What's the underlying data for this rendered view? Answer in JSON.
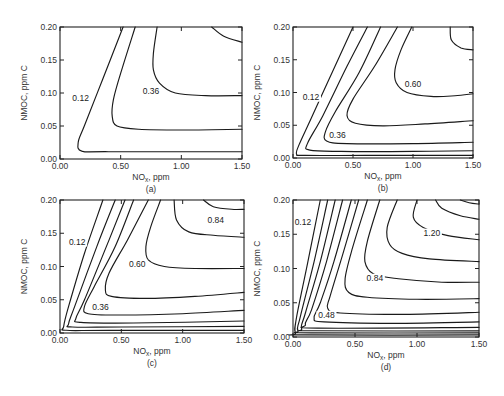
{
  "chart_data": [
    {
      "type": "contour",
      "panel": "(a)",
      "xlabel": "NOx, ppm",
      "ylabel": "NMOC, ppm C",
      "xlim": [
        0.0,
        1.5
      ],
      "ylim": [
        0.0,
        0.2
      ],
      "xticks": [
        "0.00",
        "0.50",
        "1.00",
        "1.50"
      ],
      "yticks": [
        "0.00",
        "0.05",
        "0.10",
        "0.15",
        "0.20"
      ],
      "levels": [
        0.12,
        0.24,
        0.36,
        0.48
      ],
      "labeled_levels": [
        {
          "text": "0.12",
          "x": 0.17,
          "y": 0.088
        },
        {
          "text": "0.36",
          "x": 0.75,
          "y": 0.099
        }
      ],
      "frame": {
        "x0": 60,
        "x1": 242,
        "y0": 159,
        "y1": 27
      },
      "contours": [
        [
          [
            0.52,
            0.2
          ],
          [
            0.35,
            0.12
          ],
          [
            0.2,
            0.05
          ],
          [
            0.15,
            0.025
          ],
          [
            0.18,
            0.012
          ],
          [
            0.4,
            0.011
          ],
          [
            1.5,
            0.011
          ]
        ],
        [
          [
            0.62,
            0.2
          ],
          [
            0.5,
            0.13
          ],
          [
            0.44,
            0.09
          ],
          [
            0.43,
            0.065
          ],
          [
            0.47,
            0.05
          ],
          [
            0.65,
            0.045
          ],
          [
            1.0,
            0.044
          ],
          [
            1.5,
            0.045
          ]
        ],
        [
          [
            0.8,
            0.2
          ],
          [
            0.77,
            0.16
          ],
          [
            0.77,
            0.135
          ],
          [
            0.82,
            0.115
          ],
          [
            0.95,
            0.1
          ],
          [
            1.2,
            0.096
          ],
          [
            1.5,
            0.096
          ]
        ],
        [
          [
            1.25,
            0.2
          ],
          [
            1.35,
            0.186
          ],
          [
            1.5,
            0.177
          ]
        ]
      ]
    },
    {
      "type": "contour",
      "panel": "(b)",
      "xlabel": "NOx, ppm",
      "ylabel": "NMOC, ppm C",
      "xlim": [
        0.0,
        1.5
      ],
      "ylim": [
        0.0,
        0.2
      ],
      "xticks": [
        "0.00",
        "0.50",
        "1.00",
        "1.50"
      ],
      "yticks": [
        "0.00",
        "0.05",
        "0.10",
        "0.15",
        "0.20"
      ],
      "levels": [
        0.12,
        0.24,
        0.36,
        0.48,
        0.6,
        0.72
      ],
      "labeled_levels": [
        {
          "text": "0.12",
          "x": 0.15,
          "y": 0.089
        },
        {
          "text": "0.36",
          "x": 0.37,
          "y": 0.031
        },
        {
          "text": "0.60",
          "x": 1.0,
          "y": 0.108
        }
      ],
      "frame": {
        "x0": 293,
        "x1": 473,
        "y0": 158,
        "y1": 27
      },
      "contours": [
        [
          [
            0.5,
            0.2
          ],
          [
            0.35,
            0.14
          ],
          [
            0.15,
            0.06
          ],
          [
            0.05,
            0.02
          ],
          [
            0.03,
            0.006
          ],
          [
            0.1,
            0.004
          ],
          [
            0.6,
            0.004
          ],
          [
            1.5,
            0.004
          ]
        ],
        [
          [
            0.62,
            0.2
          ],
          [
            0.45,
            0.14
          ],
          [
            0.25,
            0.065
          ],
          [
            0.12,
            0.022
          ],
          [
            0.14,
            0.012
          ],
          [
            0.4,
            0.01
          ],
          [
            1.0,
            0.01
          ],
          [
            1.5,
            0.011
          ]
        ],
        [
          [
            0.73,
            0.2
          ],
          [
            0.55,
            0.13
          ],
          [
            0.35,
            0.07
          ],
          [
            0.27,
            0.04
          ],
          [
            0.28,
            0.026
          ],
          [
            0.45,
            0.022
          ],
          [
            1.0,
            0.022
          ],
          [
            1.5,
            0.024
          ]
        ],
        [
          [
            0.87,
            0.2
          ],
          [
            0.68,
            0.14
          ],
          [
            0.5,
            0.09
          ],
          [
            0.45,
            0.065
          ],
          [
            0.52,
            0.053
          ],
          [
            0.75,
            0.049
          ],
          [
            1.1,
            0.052
          ],
          [
            1.5,
            0.057
          ]
        ],
        [
          [
            0.99,
            0.2
          ],
          [
            0.9,
            0.165
          ],
          [
            0.85,
            0.135
          ],
          [
            0.86,
            0.115
          ],
          [
            0.95,
            0.1
          ],
          [
            1.15,
            0.094
          ],
          [
            1.35,
            0.095
          ],
          [
            1.5,
            0.098
          ]
        ],
        [
          [
            1.31,
            0.2
          ],
          [
            1.32,
            0.18
          ],
          [
            1.4,
            0.168
          ],
          [
            1.5,
            0.165
          ]
        ]
      ]
    },
    {
      "type": "contour",
      "panel": "(c)",
      "xlabel": "NOx, ppm",
      "ylabel": "NMOC, ppm C",
      "xlim": [
        0.0,
        1.5
      ],
      "ylim": [
        0.0,
        0.2
      ],
      "xticks": [
        "0.00",
        "0.50",
        "1.00",
        "1.50"
      ],
      "yticks": [
        "0.00",
        "0.05",
        "0.10",
        "0.15",
        "0.20"
      ],
      "levels": [
        0.12,
        0.24,
        0.36,
        0.48,
        0.6,
        0.72,
        0.84
      ],
      "labeled_levels": [
        {
          "text": "0.12",
          "x": 0.14,
          "y": 0.133
        },
        {
          "text": "0.36",
          "x": 0.33,
          "y": 0.034
        },
        {
          "text": "0.60",
          "x": 0.63,
          "y": 0.1
        },
        {
          "text": "0.84",
          "x": 1.27,
          "y": 0.166
        }
      ],
      "frame": {
        "x0": 60,
        "x1": 244,
        "y0": 333,
        "y1": 200
      },
      "contours": [
        [
          [
            0.35,
            0.2
          ],
          [
            0.2,
            0.12
          ],
          [
            0.07,
            0.04
          ],
          [
            0.03,
            0.01
          ],
          [
            0.05,
            0.004
          ],
          [
            0.4,
            0.004
          ],
          [
            1.5,
            0.004
          ]
        ],
        [
          [
            0.45,
            0.2
          ],
          [
            0.3,
            0.13
          ],
          [
            0.12,
            0.04
          ],
          [
            0.07,
            0.014
          ],
          [
            0.1,
            0.009
          ],
          [
            0.5,
            0.009
          ],
          [
            1.5,
            0.01
          ]
        ],
        [
          [
            0.53,
            0.2
          ],
          [
            0.4,
            0.14
          ],
          [
            0.2,
            0.05
          ],
          [
            0.13,
            0.022
          ],
          [
            0.17,
            0.016
          ],
          [
            0.6,
            0.015
          ],
          [
            1.5,
            0.018
          ]
        ],
        [
          [
            0.6,
            0.2
          ],
          [
            0.45,
            0.13
          ],
          [
            0.28,
            0.07
          ],
          [
            0.2,
            0.04
          ],
          [
            0.23,
            0.029
          ],
          [
            0.5,
            0.027
          ],
          [
            1.0,
            0.029
          ],
          [
            1.5,
            0.034
          ]
        ],
        [
          [
            0.72,
            0.2
          ],
          [
            0.55,
            0.14
          ],
          [
            0.4,
            0.09
          ],
          [
            0.37,
            0.065
          ],
          [
            0.42,
            0.055
          ],
          [
            0.7,
            0.052
          ],
          [
            1.1,
            0.055
          ],
          [
            1.5,
            0.061
          ]
        ],
        [
          [
            0.82,
            0.2
          ],
          [
            0.74,
            0.16
          ],
          [
            0.7,
            0.13
          ],
          [
            0.72,
            0.11
          ],
          [
            0.85,
            0.1
          ],
          [
            1.1,
            0.097
          ],
          [
            1.5,
            0.097
          ]
        ],
        [
          [
            0.93,
            0.2
          ],
          [
            0.95,
            0.17
          ],
          [
            1.05,
            0.152
          ],
          [
            1.25,
            0.147
          ],
          [
            1.5,
            0.144
          ]
        ],
        [
          [
            1.17,
            0.2
          ],
          [
            1.25,
            0.19
          ],
          [
            1.4,
            0.186
          ],
          [
            1.5,
            0.186
          ]
        ]
      ]
    },
    {
      "type": "contour",
      "panel": "(d)",
      "xlabel": "NOx, ppm",
      "ylabel": "NMOC, ppm C",
      "xlim": [
        0.0,
        1.5
      ],
      "ylim": [
        0.0,
        0.2
      ],
      "xticks": [
        "0.00",
        "0.50",
        "1.00",
        "1.50"
      ],
      "yticks": [
        "0.00",
        "0.05",
        "0.10",
        "0.15",
        "0.20"
      ],
      "levels": [
        0.12,
        0.24,
        0.36,
        0.48,
        0.6,
        0.72,
        0.84,
        0.96,
        1.08,
        1.2,
        1.32,
        1.44
      ],
      "labeled_levels": [
        {
          "text": "0.12",
          "x": 0.08,
          "y": 0.163
        },
        {
          "text": "0.48",
          "x": 0.27,
          "y": 0.028
        },
        {
          "text": "0.84",
          "x": 0.66,
          "y": 0.082
        },
        {
          "text": "1.20",
          "x": 1.12,
          "y": 0.148
        }
      ],
      "frame": {
        "x0": 293,
        "x1": 479,
        "y0": 337,
        "y1": 200
      },
      "contours": [
        [
          [
            0.22,
            0.2
          ],
          [
            0.12,
            0.11
          ],
          [
            0.03,
            0.03
          ],
          [
            0.02,
            0.006
          ],
          [
            0.1,
            0.003
          ],
          [
            1.5,
            0.003
          ]
        ],
        [
          [
            0.28,
            0.2
          ],
          [
            0.17,
            0.11
          ],
          [
            0.06,
            0.03
          ],
          [
            0.04,
            0.009
          ],
          [
            0.15,
            0.006
          ],
          [
            1.5,
            0.006
          ]
        ],
        [
          [
            0.34,
            0.2
          ],
          [
            0.22,
            0.11
          ],
          [
            0.1,
            0.035
          ],
          [
            0.07,
            0.012
          ],
          [
            0.18,
            0.009
          ],
          [
            1.5,
            0.009
          ]
        ],
        [
          [
            0.4,
            0.2
          ],
          [
            0.27,
            0.11
          ],
          [
            0.15,
            0.04
          ],
          [
            0.1,
            0.018
          ],
          [
            0.2,
            0.013
          ],
          [
            1.5,
            0.014
          ]
        ],
        [
          [
            0.47,
            0.2
          ],
          [
            0.33,
            0.11
          ],
          [
            0.22,
            0.05
          ],
          [
            0.17,
            0.028
          ],
          [
            0.25,
            0.022
          ],
          [
            0.8,
            0.02
          ],
          [
            1.5,
            0.022
          ]
        ],
        [
          [
            0.53,
            0.2
          ],
          [
            0.4,
            0.12
          ],
          [
            0.3,
            0.06
          ],
          [
            0.28,
            0.042
          ],
          [
            0.38,
            0.035
          ],
          [
            0.9,
            0.033
          ],
          [
            1.5,
            0.036
          ]
        ],
        [
          [
            0.6,
            0.2
          ],
          [
            0.48,
            0.13
          ],
          [
            0.42,
            0.085
          ],
          [
            0.45,
            0.065
          ],
          [
            0.6,
            0.058
          ],
          [
            1.0,
            0.055
          ],
          [
            1.5,
            0.056
          ]
        ],
        [
          [
            0.7,
            0.2
          ],
          [
            0.6,
            0.14
          ],
          [
            0.58,
            0.11
          ],
          [
            0.65,
            0.092
          ],
          [
            0.85,
            0.085
          ],
          [
            1.2,
            0.08
          ],
          [
            1.5,
            0.08
          ]
        ],
        [
          [
            0.84,
            0.2
          ],
          [
            0.76,
            0.16
          ],
          [
            0.78,
            0.135
          ],
          [
            0.88,
            0.122
          ],
          [
            1.1,
            0.114
          ],
          [
            1.5,
            0.11
          ]
        ],
        [
          [
            1.0,
            0.2
          ],
          [
            0.97,
            0.175
          ],
          [
            1.05,
            0.16
          ],
          [
            1.25,
            0.148
          ],
          [
            1.5,
            0.142
          ]
        ],
        [
          [
            1.15,
            0.2
          ],
          [
            1.2,
            0.188
          ],
          [
            1.35,
            0.177
          ],
          [
            1.5,
            0.172
          ]
        ],
        [
          [
            1.35,
            0.2
          ],
          [
            1.42,
            0.196
          ],
          [
            1.5,
            0.194
          ]
        ]
      ]
    }
  ],
  "figure": {
    "panels": [
      {
        "id": "a",
        "caption": "(a)",
        "xlabel_main": "NO",
        "xlabel_sub": "x",
        "xlabel_tail": ", ppm",
        "ylabel": "NMOC, ppm C"
      },
      {
        "id": "b",
        "caption": "(b)",
        "xlabel_main": "NO",
        "xlabel_sub": "x",
        "xlabel_tail": ", ppm",
        "ylabel": "NMOC, ppm C"
      },
      {
        "id": "c",
        "caption": "(c)",
        "xlabel_main": "NO",
        "xlabel_sub": "x",
        "xlabel_tail": ", ppm",
        "ylabel": "NMOC, ppm C"
      },
      {
        "id": "d",
        "caption": "(d)",
        "xlabel_main": "NO",
        "xlabel_sub": "x",
        "xlabel_tail": ", ppm",
        "ylabel": "NMOC, ppm C"
      }
    ]
  }
}
